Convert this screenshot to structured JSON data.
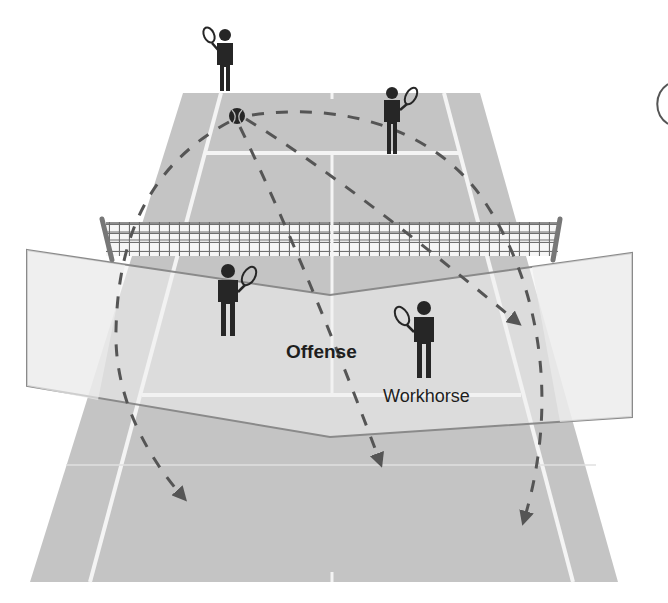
{
  "diagram": {
    "labels": {
      "offense": "Offense",
      "workhorse": "Workhorse"
    },
    "colors": {
      "court": "#c4c4c4",
      "court_lines": "#f2f2f2",
      "panel_fill": "#ececec",
      "panel_edge": "#8a8a8a",
      "net_mesh": "#6e6e6e",
      "net_post": "#777777",
      "player": "#262626",
      "trajectory": "#555555",
      "text": "#1e1e1e"
    },
    "players": [
      {
        "id": "far-baseline",
        "x": 215,
        "y": 65
      },
      {
        "id": "far-net-right",
        "x": 392,
        "y": 120
      },
      {
        "id": "near-left",
        "x": 228,
        "y": 298
      },
      {
        "id": "near-right-workhorse",
        "x": 423,
        "y": 338
      }
    ],
    "ball": {
      "x": 237,
      "y": 116
    },
    "trajectories": [
      {
        "to": "near-left-deep",
        "end": [
          183,
          497
        ]
      },
      {
        "to": "center-deep",
        "end": [
          380,
          462
        ]
      },
      {
        "to": "right-service",
        "end": [
          517,
          322
        ]
      },
      {
        "to": "right-deep",
        "end": [
          524,
          520
        ]
      }
    ]
  }
}
